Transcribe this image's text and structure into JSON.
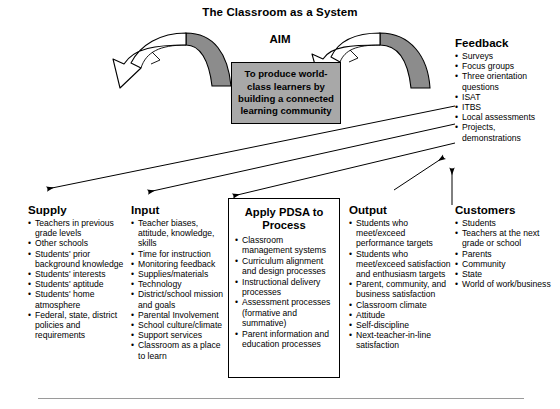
{
  "diagram": {
    "title": "The Classroom as a System",
    "aim_label": "AIM",
    "aim_statement": "To produce world-class learners by building a connected learning community",
    "colors": {
      "aim_box_fill": "#a8a8a8",
      "arc_shade": "#8c8c8c",
      "outline": "#000000",
      "background": "#ffffff",
      "rule": "#9a9a9a"
    }
  },
  "columns": {
    "feedback": {
      "heading": "Feedback",
      "items": [
        "Surveys",
        "Focus groups",
        "Three orientation questions",
        "ISAT",
        "ITBS",
        "Local assessments",
        "Projects, demonstrations"
      ]
    },
    "supply": {
      "heading": "Supply",
      "items": [
        "Teachers in previous grade levels",
        "Other schools",
        "Students' prior background knowledge",
        "Students' interests",
        "Students' aptitude",
        "Students' home atmosphere",
        "Federal, state, district policies and requirements"
      ]
    },
    "input": {
      "heading": "Input",
      "items": [
        "Teacher biases, attitude, knowledge, skills",
        "Time for instruction",
        "Monitoring feedback",
        "Supplies/materials",
        "Technology",
        "District/school mission and goals",
        "Parental Involvement",
        "School culture/climate",
        "Support services",
        "Classroom as a place to learn"
      ]
    },
    "pdsa": {
      "heading": "Apply PDSA to Process",
      "items": [
        "Classroom management systems",
        "Curriculum alignment and design processes",
        "Instructional delivery processes",
        "Assessment processes (formative and summative)",
        "Parent information and education processes"
      ]
    },
    "output": {
      "heading": "Output",
      "items": [
        "Students who meet/exceed performance targets",
        "Students who meet/exceed satisfaction and enthusiasm targets",
        "Parent, community, and business satisfaction",
        "Classroom climate",
        "Attitude",
        "Self-discipline",
        "Next-teacher-in-line satisfaction"
      ]
    },
    "customers": {
      "heading": "Customers",
      "items": [
        "Students",
        "Teachers at the next grade or school",
        "Parents",
        "Community",
        "State",
        "World of work/business"
      ]
    }
  }
}
